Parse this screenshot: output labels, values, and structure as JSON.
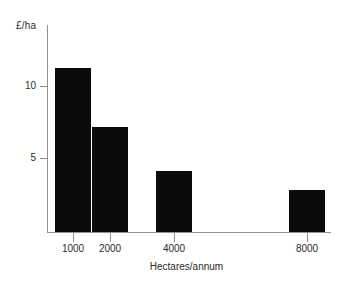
{
  "chart_data": {
    "type": "bar",
    "title": "",
    "subtitle": "",
    "xlabel": "Hectares/annum",
    "ylabel": "£/ha",
    "categories": [
      "1000",
      "2000",
      "4000",
      "8000"
    ],
    "values": [
      11.25,
      7.2,
      4.2,
      2.9
    ],
    "series": [
      {
        "name": "Cost per hectare",
        "values": [
          11.25,
          7.2,
          4.2,
          2.9
        ]
      }
    ],
    "y_ticks": [
      5,
      10
    ],
    "y_tick_labels": [
      "5",
      "10"
    ],
    "ylim": [
      0,
      14.4
    ],
    "x_tick_labels": [
      "1000",
      "2000",
      "4000",
      "8000"
    ],
    "grid": false,
    "legend": false,
    "legend_position": "none",
    "bar_color": "#0b0b0b",
    "axis_color": "#8f8f8f",
    "text_color": "#2b2b2b",
    "background_color": "#ffffff",
    "annotations": [],
    "note": "Bar widths are uniform; x positions are proportional to log-spaced category placement, with a gap between 4000 and 8000."
  },
  "axes": {
    "y_axis_title": "£/ha",
    "x_axis_title": "Hectares/annum"
  },
  "y_ticks": [
    {
      "label": "10",
      "value": 10
    },
    {
      "label": "5",
      "value": 5
    }
  ],
  "x_ticks": [
    {
      "label": "1000",
      "value": 1000
    },
    {
      "label": "2000",
      "value": 2000
    },
    {
      "label": "4000",
      "value": 4000
    },
    {
      "label": "8000",
      "value": 8000
    }
  ],
  "bars": [
    {
      "label": "1000",
      "value": 11.25
    },
    {
      "label": "2000",
      "value": 7.2
    },
    {
      "label": "4000",
      "value": 4.2
    },
    {
      "label": "8000",
      "value": 2.9
    }
  ]
}
